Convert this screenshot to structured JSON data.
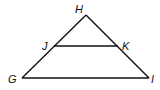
{
  "diagram": {
    "type": "triangle-with-midsegment",
    "points": {
      "H": {
        "label": "H",
        "x": 86,
        "y": 15,
        "lx": 76,
        "ly": 12
      },
      "J": {
        "label": "J",
        "x": 54,
        "y": 46,
        "lx": 42,
        "ly": 50
      },
      "K": {
        "label": "K",
        "x": 118,
        "y": 46,
        "lx": 122,
        "ly": 50
      },
      "G": {
        "label": "G",
        "x": 22,
        "y": 78,
        "lx": 8,
        "ly": 82
      },
      "I": {
        "label": "I",
        "x": 149,
        "y": 78,
        "lx": 151,
        "ly": 82
      }
    },
    "segments": [
      [
        "G",
        "H"
      ],
      [
        "H",
        "I"
      ],
      [
        "G",
        "I"
      ],
      [
        "J",
        "K"
      ]
    ],
    "color": "#111111"
  }
}
